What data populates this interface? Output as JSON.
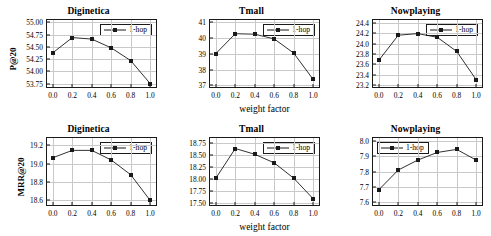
{
  "figure": {
    "legend_label": "1-hop",
    "xlabel": "weight factor",
    "line_color": "#1a1a1a",
    "grid_color": "#c9c9c9"
  },
  "chart_data": [
    {
      "type": "line",
      "title": "Diginetica",
      "ylabel": "P@20",
      "xlabel": "",
      "series": [
        {
          "name": "1-hop",
          "values": [
            54.38,
            54.69,
            54.66,
            54.48,
            54.22,
            53.75
          ]
        }
      ],
      "x": [
        0.0,
        0.2,
        0.4,
        0.6,
        0.8,
        1.0
      ],
      "categories": [
        "0.0",
        "0.2",
        "0.4",
        "0.6",
        "0.8",
        "1.0"
      ],
      "xticks": [
        "0.0",
        "0.2",
        "0.4",
        "0.6",
        "0.8",
        "1.0"
      ],
      "yticks": [
        "53.75",
        "54.00",
        "54.25",
        "54.50",
        "54.75",
        "55.00"
      ],
      "ytick_values": [
        53.75,
        54.0,
        54.25,
        54.5,
        54.75,
        55.0
      ],
      "xlim": [
        -0.06,
        1.06
      ],
      "ylim": [
        53.68,
        55.05
      ],
      "grid": true,
      "legend_position": "upper right"
    },
    {
      "type": "line",
      "title": "Tmall",
      "ylabel": "",
      "xlabel": "weight factor",
      "series": [
        {
          "name": "1-hop",
          "values": [
            39.02,
            40.28,
            40.25,
            39.95,
            39.05,
            37.38
          ]
        }
      ],
      "x": [
        0.0,
        0.2,
        0.4,
        0.6,
        0.8,
        1.0
      ],
      "categories": [
        "0.0",
        "0.2",
        "0.4",
        "0.6",
        "0.8",
        "1.0"
      ],
      "xticks": [
        "0.0",
        "0.2",
        "0.4",
        "0.6",
        "0.8",
        "1.0"
      ],
      "yticks": [
        "37",
        "38",
        "39",
        "40",
        "41"
      ],
      "ytick_values": [
        37,
        38,
        39,
        40,
        41
      ],
      "xlim": [
        -0.06,
        1.06
      ],
      "ylim": [
        36.9,
        41.15
      ],
      "grid": true,
      "legend_position": "upper right"
    },
    {
      "type": "line",
      "title": "Nowplaying",
      "ylabel": "",
      "xlabel": "",
      "series": [
        {
          "name": "1-hop",
          "values": [
            23.68,
            24.16,
            24.19,
            24.12,
            23.85,
            23.31
          ]
        }
      ],
      "x": [
        0.0,
        0.2,
        0.4,
        0.6,
        0.8,
        1.0
      ],
      "categories": [
        "0.0",
        "0.2",
        "0.4",
        "0.6",
        "0.8",
        "1.0"
      ],
      "xticks": [
        "0.0",
        "0.2",
        "0.4",
        "0.6",
        "0.8",
        "1.0"
      ],
      "yticks": [
        "23.2",
        "23.4",
        "23.6",
        "23.8",
        "24.0",
        "24.2",
        "24.4"
      ],
      "ytick_values": [
        23.2,
        23.4,
        23.6,
        23.8,
        24.0,
        24.2,
        24.4
      ],
      "xlim": [
        -0.06,
        1.06
      ],
      "ylim": [
        23.17,
        24.45
      ],
      "grid": true,
      "legend_position": "upper right"
    },
    {
      "type": "line",
      "title": "Diginetica",
      "ylabel": "MRR@20",
      "xlabel": "",
      "series": [
        {
          "name": "1-hop",
          "values": [
            19.065,
            19.145,
            19.145,
            19.04,
            18.88,
            18.6
          ]
        }
      ],
      "x": [
        0.0,
        0.2,
        0.4,
        0.6,
        0.8,
        1.0
      ],
      "categories": [
        "0.0",
        "0.2",
        "0.4",
        "0.6",
        "0.8",
        "1.0"
      ],
      "xticks": [
        "0.0",
        "0.2",
        "0.4",
        "0.6",
        "0.8",
        "1.0"
      ],
      "yticks": [
        "18.6",
        "18.8",
        "19.0",
        "19.2"
      ],
      "ytick_values": [
        18.6,
        18.8,
        19.0,
        19.2
      ],
      "xlim": [
        -0.06,
        1.06
      ],
      "ylim": [
        18.55,
        19.28
      ],
      "grid": true,
      "legend_position": "upper right"
    },
    {
      "type": "line",
      "title": "Tmall",
      "ylabel": "",
      "xlabel": "weight factor",
      "series": [
        {
          "name": "1-hop",
          "values": [
            18.01,
            18.63,
            18.51,
            18.33,
            18.01,
            17.58
          ]
        }
      ],
      "x": [
        0.0,
        0.2,
        0.4,
        0.6,
        0.8,
        1.0
      ],
      "categories": [
        "0.0",
        "0.2",
        "0.4",
        "0.6",
        "0.8",
        "1.0"
      ],
      "xticks": [
        "0.0",
        "0.2",
        "0.4",
        "0.6",
        "0.8",
        "1.0"
      ],
      "yticks": [
        "17.50",
        "17.75",
        "18.00",
        "18.25",
        "18.50",
        "18.75"
      ],
      "ytick_values": [
        17.5,
        17.75,
        18.0,
        18.25,
        18.5,
        18.75
      ],
      "xlim": [
        -0.06,
        1.06
      ],
      "ylim": [
        17.45,
        18.85
      ],
      "grid": true,
      "legend_position": "upper right"
    },
    {
      "type": "line",
      "title": "Nowplaying",
      "ylabel": "",
      "xlabel": "",
      "series": [
        {
          "name": "1-hop",
          "values": [
            7.68,
            7.81,
            7.875,
            7.925,
            7.945,
            7.875
          ]
        }
      ],
      "x": [
        0.0,
        0.2,
        0.4,
        0.6,
        0.8,
        1.0
      ],
      "categories": [
        "0.0",
        "0.2",
        "0.4",
        "0.6",
        "0.8",
        "1.0"
      ],
      "xticks": [
        "0.0",
        "0.2",
        "0.4",
        "0.6",
        "0.8",
        "1.0"
      ],
      "yticks": [
        "7.6",
        "7.7",
        "7.8",
        "7.9",
        "8.0"
      ],
      "ytick_values": [
        7.6,
        7.7,
        7.8,
        7.9,
        8.0
      ],
      "xlim": [
        -0.06,
        1.06
      ],
      "ylim": [
        7.58,
        8.02
      ],
      "grid": true,
      "legend_position": "upper left"
    }
  ]
}
